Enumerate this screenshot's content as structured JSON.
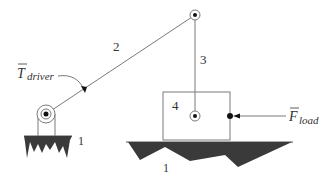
{
  "diagram": {
    "type": "slider-crank mechanism (kinematic diagram)",
    "links": {
      "ground_label_left": "1",
      "ground_label_right": "1",
      "crank_label": "2",
      "coupler_label": "3",
      "slider_label": "4"
    },
    "driver_torque": {
      "symbol": "T",
      "subscript": "driver"
    },
    "load_force": {
      "symbol": "F",
      "subscript": "load"
    },
    "colors": {
      "line": "#7a7a7a",
      "ground_fill": "#3a3a3a",
      "text": "#333333",
      "pin": "#111111",
      "background": "#ffffff"
    }
  }
}
